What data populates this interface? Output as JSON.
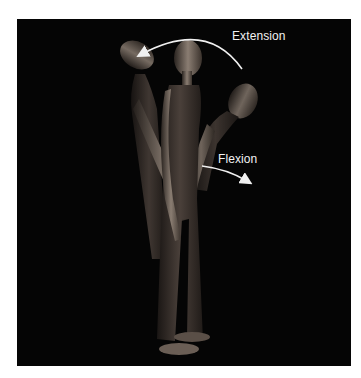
{
  "figure": {
    "background_color": "#050505",
    "labels": {
      "extension": "Extension",
      "flexion": "Flexion"
    },
    "arrows": [
      {
        "name": "extension-arrow",
        "direction": "backward-up",
        "color": "#f0f0f0"
      },
      {
        "name": "flexion-arrow",
        "direction": "forward-down",
        "color": "#f0f0f0"
      }
    ],
    "poses": [
      "extension",
      "neutral",
      "flexion"
    ]
  }
}
